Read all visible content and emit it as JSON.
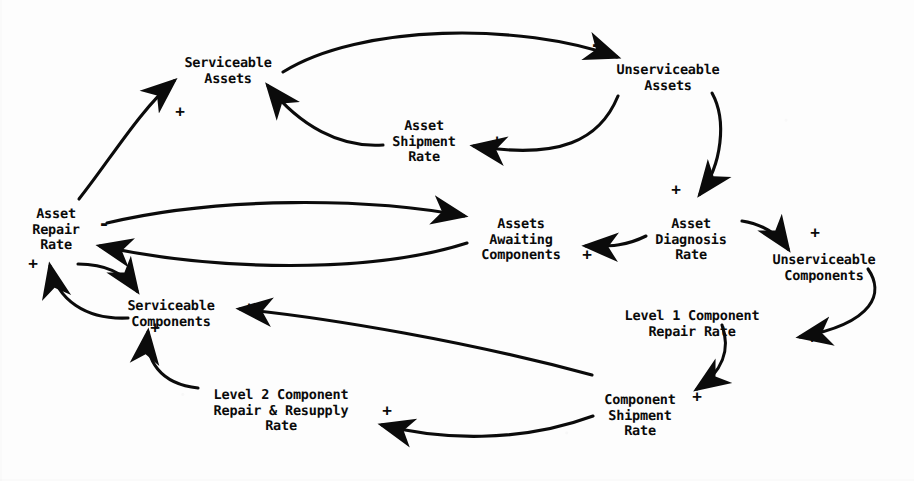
{
  "diagram": {
    "type": "causal-loop-diagram",
    "width": 914,
    "height": 481,
    "ink_color": "#0b0b0b",
    "background_color": "#fdfdfd",
    "nodes": [
      {
        "id": "serviceable_assets",
        "label": "Serviceable\nAssets",
        "x": 228,
        "y": 56
      },
      {
        "id": "unserviceable_assets",
        "label": "Unserviceable\nAssets",
        "x": 668,
        "y": 63
      },
      {
        "id": "asset_shipment_rate",
        "label": "Asset\nShipment\nRate",
        "x": 424,
        "y": 119
      },
      {
        "id": "asset_repair_rate",
        "label": "Asset\nRepair\nRate",
        "x": 56,
        "y": 207
      },
      {
        "id": "assets_awaiting",
        "label": "Assets\nAwaiting\nComponents",
        "x": 521,
        "y": 217
      },
      {
        "id": "asset_diagnosis_rate",
        "label": "Asset\nDiagnosis\nRate",
        "x": 691,
        "y": 217
      },
      {
        "id": "unserviceable_comp",
        "label": "Unserviceable\nComponents",
        "x": 824,
        "y": 253
      },
      {
        "id": "serviceable_comp",
        "label": "Serviceable\nComponents",
        "x": 171,
        "y": 299
      },
      {
        "id": "level1_repair_rate",
        "label": "Level 1 Component\nRepair Rate",
        "x": 692,
        "y": 309
      },
      {
        "id": "level2_repair_rate",
        "label": "Level 2 Component\nRepair & Resupply\nRate",
        "x": 281,
        "y": 388
      },
      {
        "id": "component_shipment",
        "label": "Component\nShipment\nRate",
        "x": 640,
        "y": 393
      }
    ],
    "edges": [
      {
        "id": "e1",
        "from": "serviceable_assets",
        "to": "unserviceable_assets",
        "polarity": "-",
        "sign_x": 596,
        "sign_y": 44
      },
      {
        "id": "e2",
        "from": "asset_shipment_rate",
        "to": "serviceable_assets",
        "polarity": "-",
        "sign_x": 290,
        "sign_y": 99
      },
      {
        "id": "e3",
        "from": "unserviceable_assets",
        "to": "asset_shipment_rate",
        "polarity": "+",
        "sign_x": 497,
        "sign_y": 141
      },
      {
        "id": "e4",
        "from": "asset_repair_rate",
        "to": "serviceable_assets",
        "polarity": "+",
        "sign_x": 180,
        "sign_y": 112
      },
      {
        "id": "e5",
        "from": "unserviceable_assets",
        "to": "asset_diagnosis_rate",
        "polarity": "+",
        "sign_x": 676,
        "sign_y": 190
      },
      {
        "id": "e6",
        "from": "asset_repair_rate",
        "to": "assets_awaiting",
        "polarity": "-",
        "sign_x": 104,
        "sign_y": 223
      },
      {
        "id": "e7",
        "from": "assets_awaiting",
        "to": "asset_repair_rate",
        "polarity": "-",
        "sign_x": 104,
        "sign_y": 223
      },
      {
        "id": "e8",
        "from": "asset_diagnosis_rate",
        "to": "assets_awaiting",
        "polarity": "+",
        "sign_x": 587,
        "sign_y": 255
      },
      {
        "id": "e9",
        "from": "asset_diagnosis_rate",
        "to": "unserviceable_comp",
        "polarity": "+",
        "sign_x": 815,
        "sign_y": 233
      },
      {
        "id": "e10",
        "from": "serviceable_comp",
        "to": "asset_repair_rate",
        "polarity": "+",
        "sign_x": 33,
        "sign_y": 264
      },
      {
        "id": "e11",
        "from": "asset_repair_rate",
        "to": "serviceable_comp",
        "polarity": "-",
        "sign_x": 128,
        "sign_y": 279
      },
      {
        "id": "e12",
        "from": "unserviceable_comp",
        "to": "level1_repair_rate",
        "polarity": "+",
        "sign_x": 812,
        "sign_y": 338
      },
      {
        "id": "e13",
        "from": "component_shipment",
        "to": "serviceable_comp",
        "polarity": "+",
        "sign_x": 249,
        "sign_y": 308
      },
      {
        "id": "e14",
        "from": "level1_repair_rate",
        "to": "component_shipment",
        "polarity": "+",
        "sign_x": 697,
        "sign_y": 397
      },
      {
        "id": "e15",
        "from": "level2_repair_rate",
        "to": "serviceable_comp",
        "polarity": "+",
        "sign_x": 155,
        "sign_y": 328
      },
      {
        "id": "e16",
        "from": "component_shipment",
        "to": "level2_repair_rate",
        "polarity": "+",
        "sign_x": 387,
        "sign_y": 411
      }
    ]
  }
}
